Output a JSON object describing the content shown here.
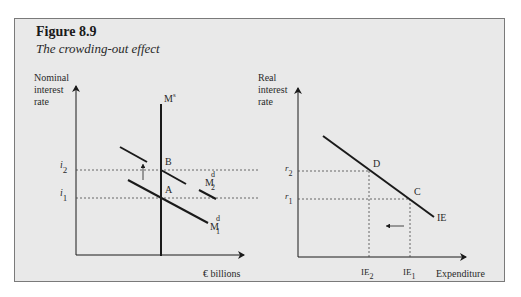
{
  "figure": {
    "number": "Figure 8.9",
    "title": "The crowding-out effect",
    "background": "#e9e9e9",
    "border_color": "#7a7a7a"
  },
  "left_panel": {
    "y_axis_label": [
      "Nominal",
      "interest",
      "rate"
    ],
    "x_axis_label": "€  billions",
    "supply_label": "M",
    "supply_sup": "s",
    "demand1_label": "M",
    "demand1_sup": "d",
    "demand1_sub": "1",
    "demand2_label": "M",
    "demand2_sup": "d",
    "demand2_sub": "2",
    "point_a": "A",
    "point_b": "B",
    "tick_i1": "i",
    "tick_i1_sub": "1",
    "tick_i2": "i",
    "tick_i2_sub": "2"
  },
  "right_panel": {
    "y_axis_label": [
      "Real",
      "interest",
      "rate"
    ],
    "x_axis_label": "Expenditure",
    "curve_label": "IE",
    "point_c": "C",
    "point_d": "D",
    "tick_r1": "r",
    "tick_r1_sub": "1",
    "tick_r2": "r",
    "tick_r2_sub": "2",
    "tick_ie1": "IE",
    "tick_ie1_sub": "1",
    "tick_ie2": "IE",
    "tick_ie2_sub": "2"
  }
}
